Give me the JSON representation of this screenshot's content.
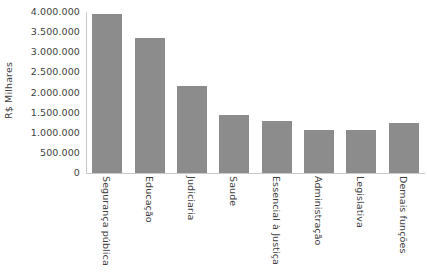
{
  "chart_data": {
    "type": "bar",
    "title": "",
    "xlabel": "",
    "ylabel": "R$ Milhares",
    "ylim": [
      0,
      4000000
    ],
    "grid": false,
    "legend": null,
    "categories": [
      "Segurança pública",
      "Educação",
      "Judiciaria",
      "Saude",
      "Essencial à Justiça",
      "Administração",
      "Legislativa",
      "Demais funções"
    ],
    "values": [
      3950000,
      3350000,
      2150000,
      1450000,
      1300000,
      1080000,
      1060000,
      1250000
    ],
    "ytick_labels": [
      "4.000.000",
      "3.500.000",
      "3.000.000",
      "2.500.000",
      "2.000.000",
      "1.500.000",
      "1.000.000",
      "500.000",
      "0"
    ],
    "ytick_values": [
      4000000,
      3500000,
      3000000,
      2500000,
      2000000,
      1500000,
      1000000,
      500000,
      0
    ],
    "bar_color": "#8c8c8c",
    "axis_color": "#c9c9c9",
    "text_color": "#3f3f3f"
  }
}
